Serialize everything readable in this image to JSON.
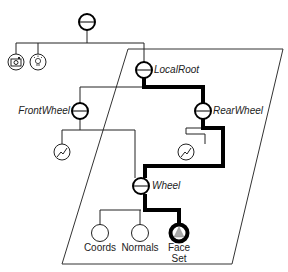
{
  "diagram": {
    "type": "scene-graph",
    "colors": {
      "line": "#222222",
      "highlight_path": "#000000",
      "plane": "#333333",
      "faceset_fill": "#aaaaaa",
      "background": "#ffffff"
    },
    "nodes": {
      "root": {
        "label": "",
        "kind": "separator"
      },
      "camera": {
        "label": "",
        "kind": "camera",
        "icon": "camera-icon"
      },
      "light": {
        "label": "",
        "kind": "light",
        "icon": "lightbulb-icon"
      },
      "local_root": {
        "label": "LocalRoot",
        "kind": "separator"
      },
      "front_wheel": {
        "label": "FrontWheel",
        "kind": "separator"
      },
      "rear_wheel": {
        "label": "RearWheel",
        "kind": "separator"
      },
      "front_engraving": {
        "label": "",
        "kind": "engraving",
        "icon": "engraving-icon"
      },
      "rear_engraving": {
        "label": "",
        "kind": "engraving",
        "icon": "engraving-icon"
      },
      "wheel": {
        "label": "Wheel",
        "kind": "separator"
      },
      "coords": {
        "label": "Coords",
        "kind": "property"
      },
      "normals": {
        "label": "Normals",
        "kind": "property"
      },
      "face_set": {
        "label_line1": "Face",
        "label_line2": "Set",
        "kind": "shape"
      }
    },
    "highlighted_path": [
      "local_root",
      "rear_wheel",
      "wheel",
      "face_set"
    ]
  }
}
